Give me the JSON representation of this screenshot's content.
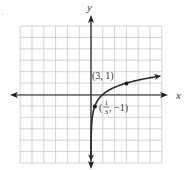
{
  "chart_data": {
    "type": "line",
    "title": "",
    "function": "y = log_3(x)",
    "xlabel": "x",
    "ylabel": "y",
    "xlim": [
      -6,
      6
    ],
    "ylim": [
      -6,
      6
    ],
    "grid": true,
    "grid_step": 1,
    "legend": null,
    "series": [
      {
        "name": "curve",
        "x": [
          0.0045,
          0.0137,
          0.0412,
          0.1111,
          0.3333,
          1,
          2,
          3,
          4,
          5,
          6
        ],
        "y": [
          -4.9,
          -3.9,
          -2.9,
          -2,
          -1,
          0,
          0.63,
          1,
          1.26,
          1.46,
          1.63
        ]
      }
    ],
    "points": [
      {
        "x": 3,
        "y": 1,
        "label": "(3, 1)"
      },
      {
        "x": 0.3333,
        "y": -1,
        "label": "(1/3, −1)"
      }
    ],
    "annotations": [
      "(3, 1)",
      "(1/3, −1)"
    ]
  },
  "labels": {
    "x_axis": "x",
    "y_axis": "y",
    "point_a": "(3, 1)",
    "point_b_open": "(",
    "point_b_num": "1",
    "point_b_den": "3",
    "point_b_close": ", −1)",
    "corner_mark": "."
  },
  "colors": {
    "grid": "#c8c8c8",
    "axis": "#1a1a1a",
    "curve": "#2a2a2a",
    "text": "#333333"
  }
}
